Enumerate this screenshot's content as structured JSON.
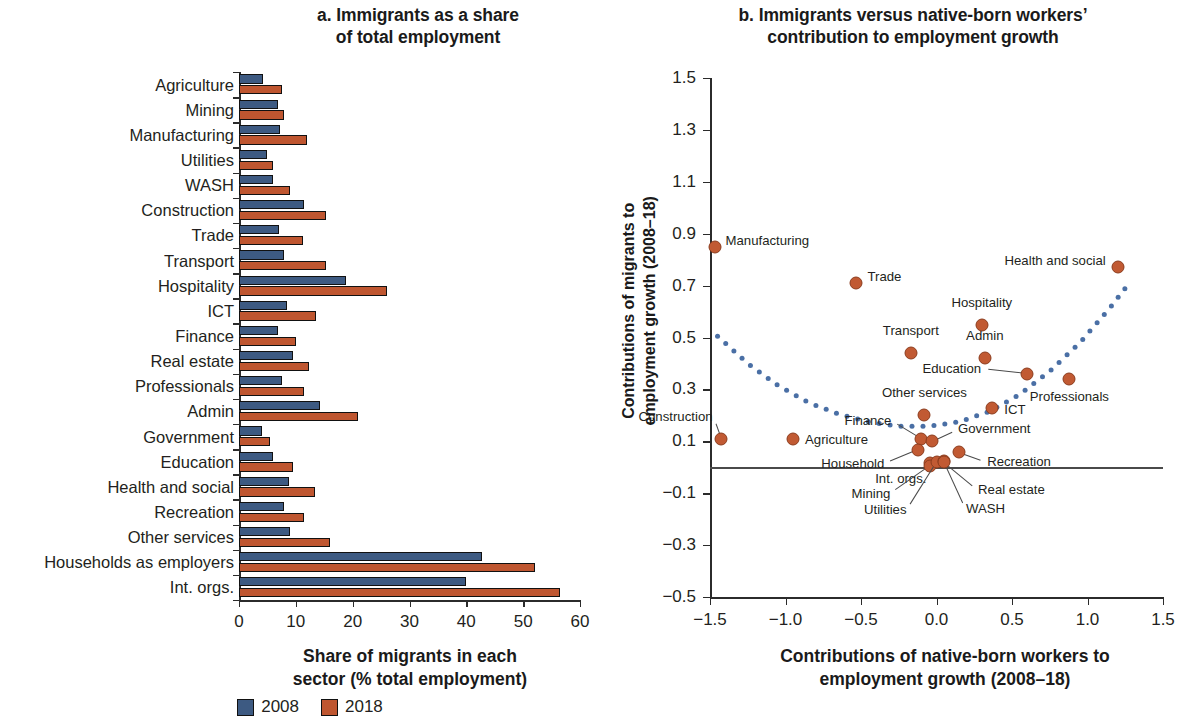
{
  "panel_a": {
    "title": "a. Immigrants as a share of total employment",
    "title_line1": "a. Immigrants as a share",
    "title_line2": "of total employment",
    "xlabel_line1": "Share of migrants in each",
    "xlabel_line2": "sector (% total employment)",
    "xticks": [
      "0",
      "10",
      "20",
      "30",
      "40",
      "50",
      "60"
    ]
  },
  "panel_b": {
    "title_line1": "b. Immigrants versus native-born workers’",
    "title_line2": "contribution to employment growth",
    "xlabel_line1": "Contributions of native-born workers to",
    "xlabel_line2": "employment growth (2008–18)",
    "ylabel_line1": "Contributions of migrants to",
    "ylabel_line2": "employment growth (2008–18)",
    "xticks": [
      "−1.5",
      "−1.0",
      "−0.5",
      "0.0",
      "0.5",
      "1.0",
      "1.5"
    ],
    "yticks": [
      "1.5",
      "1.3",
      "1.1",
      "0.9",
      "0.7",
      "0.5",
      "0.3",
      "0.1",
      "−0.1",
      "−0.3",
      "−0.5"
    ]
  },
  "legend": {
    "items": [
      {
        "label": "2008",
        "color": "#3d5a82"
      },
      {
        "label": "2018",
        "color": "#bf5630"
      }
    ]
  },
  "colors": {
    "series_2008": "#3d5a82",
    "series_2018": "#bf5630",
    "scatter_point": "#c15a33",
    "trendline": "#4a6fa5",
    "axis": "#2b2b2b"
  },
  "chart_data": [
    {
      "type": "bar",
      "orientation": "horizontal",
      "title": "a. Immigrants as a share of total employment",
      "xlabel": "Share of migrants in each sector (% total employment)",
      "ylabel": "",
      "xlim": [
        0,
        60
      ],
      "grid": false,
      "legend_position": "bottom",
      "categories": [
        "Agriculture",
        "Mining",
        "Manufacturing",
        "Utilities",
        "WASH",
        "Construction",
        "Trade",
        "Transport",
        "Hospitality",
        "ICT",
        "Finance",
        "Real estate",
        "Professionals",
        "Admin",
        "Government",
        "Education",
        "Health and social",
        "Recreation",
        "Other services",
        "Households as employers",
        "Int. orgs."
      ],
      "series": [
        {
          "name": "2008",
          "color": "#3d5a82",
          "values": [
            4.2,
            6.8,
            7.3,
            5.0,
            6.0,
            11.5,
            7.0,
            8.0,
            18.8,
            8.5,
            6.8,
            9.5,
            7.5,
            14.3,
            4.0,
            6.0,
            8.8,
            8.0,
            9.0,
            42.8,
            40.0
          ]
        },
        {
          "name": "2018",
          "color": "#bf5630",
          "values": [
            7.5,
            8.0,
            12.0,
            6.0,
            9.0,
            15.3,
            11.3,
            15.3,
            26.0,
            13.5,
            10.0,
            12.3,
            11.5,
            21.0,
            5.5,
            9.5,
            13.3,
            11.5,
            16.0,
            52.0,
            56.5
          ]
        }
      ]
    },
    {
      "type": "scatter",
      "title": "b. Immigrants versus native-born workers’ contribution to employment growth",
      "xlabel": "Contributions of native-born workers to employment growth (2008–18)",
      "ylabel": "Contributions of migrants to employment growth (2008–18)",
      "xlim": [
        -1.5,
        1.5
      ],
      "ylim": [
        -0.5,
        1.5
      ],
      "grid": false,
      "legend_position": "none",
      "zero_line_y": 0,
      "points": [
        {
          "label": "Manufacturing",
          "x": -1.47,
          "y": 0.85,
          "label_pos": "right"
        },
        {
          "label": "Trade",
          "x": -0.53,
          "y": 0.71,
          "label_pos": "right"
        },
        {
          "label": "Health and social",
          "x": 1.2,
          "y": 0.77,
          "label_pos": "left"
        },
        {
          "label": "Hospitality",
          "x": 0.3,
          "y": 0.55,
          "label_pos": "above"
        },
        {
          "label": "Transport",
          "x": -0.17,
          "y": 0.44,
          "label_pos": "above"
        },
        {
          "label": "Admin",
          "x": 0.32,
          "y": 0.42,
          "label_pos": "above"
        },
        {
          "label": "Education",
          "x": 0.6,
          "y": 0.36,
          "label_pos": "leader-left"
        },
        {
          "label": "Professionals",
          "x": 0.88,
          "y": 0.34,
          "label_pos": "below"
        },
        {
          "label": "ICT",
          "x": 0.37,
          "y": 0.23,
          "label_pos": "right"
        },
        {
          "label": "Other services",
          "x": -0.08,
          "y": 0.2,
          "label_pos": "above"
        },
        {
          "label": "Construction",
          "x": -1.43,
          "y": 0.11,
          "label_pos": "leader-right"
        },
        {
          "label": "Agriculture",
          "x": -0.95,
          "y": 0.11,
          "label_pos": "right"
        },
        {
          "label": "Finance",
          "x": -0.1,
          "y": 0.11,
          "label_pos": "leader-left"
        },
        {
          "label": "Government",
          "x": -0.03,
          "y": 0.1,
          "label_pos": "leader-right"
        },
        {
          "label": "Recreation",
          "x": 0.15,
          "y": 0.06,
          "label_pos": "leader-right"
        },
        {
          "label": "Household",
          "x": -0.12,
          "y": 0.065,
          "label_pos": "leader-left"
        },
        {
          "label": "Int. orgs.",
          "x": -0.04,
          "y": 0.015,
          "label_pos": "leader-left"
        },
        {
          "label": "Mining",
          "x": -0.04,
          "y": 0.005,
          "label_pos": "leader-below"
        },
        {
          "label": "Utilities",
          "x": 0.0,
          "y": 0.02,
          "label_pos": "leader-below"
        },
        {
          "label": "WASH",
          "x": 0.05,
          "y": 0.025,
          "label_pos": "leader-below"
        },
        {
          "label": "Real estate",
          "x": 0.05,
          "y": 0.02,
          "label_pos": "leader-right"
        }
      ],
      "trendline": {
        "style": "dotted",
        "color": "#4a6fa5",
        "points": [
          {
            "x": -1.45,
            "y": 0.505
          },
          {
            "x": -1.25,
            "y": 0.4
          },
          {
            "x": -1.05,
            "y": 0.315
          },
          {
            "x": -0.85,
            "y": 0.25
          },
          {
            "x": -0.65,
            "y": 0.205
          },
          {
            "x": -0.45,
            "y": 0.175
          },
          {
            "x": -0.25,
            "y": 0.158
          },
          {
            "x": -0.05,
            "y": 0.158
          },
          {
            "x": 0.15,
            "y": 0.175
          },
          {
            "x": 0.35,
            "y": 0.215
          },
          {
            "x": 0.55,
            "y": 0.28
          },
          {
            "x": 0.75,
            "y": 0.37
          },
          {
            "x": 0.95,
            "y": 0.48
          },
          {
            "x": 1.15,
            "y": 0.615
          },
          {
            "x": 1.25,
            "y": 0.69
          }
        ]
      }
    }
  ]
}
